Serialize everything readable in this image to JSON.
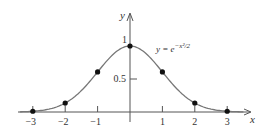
{
  "chart_data": {
    "type": "line",
    "title": "",
    "xlabel": "x",
    "ylabel": "y",
    "annotation": "y = e^{-x^2/2}",
    "annotation_display": {
      "base": "y = e",
      "exponent": "−x²/2"
    },
    "xlim": [
      -3.4,
      3.5
    ],
    "ylim": [
      0,
      1.1
    ],
    "x_ticks": [
      -3,
      -2,
      -1,
      0,
      1,
      2,
      3
    ],
    "x_tick_labels": [
      "−3",
      "−2",
      "−1",
      "1",
      "2",
      "3"
    ],
    "y_ticks": [
      0.5,
      1
    ],
    "y_tick_labels": [
      "0.5",
      "1"
    ],
    "grid": false,
    "legend": null,
    "series": [
      {
        "name": "y = e^{-x^2/2}",
        "function": "exp(-x^2/2)",
        "style": "curve",
        "color": "#777777"
      },
      {
        "name": "sample points",
        "style": "markers",
        "color": "#111111",
        "x": [
          -3,
          -2,
          -1,
          0,
          1,
          2,
          3
        ],
        "y": [
          0.011,
          0.135,
          0.607,
          1.0,
          0.607,
          0.135,
          0.011
        ]
      }
    ]
  },
  "axes": {
    "x_label": "x",
    "y_label": "y"
  }
}
